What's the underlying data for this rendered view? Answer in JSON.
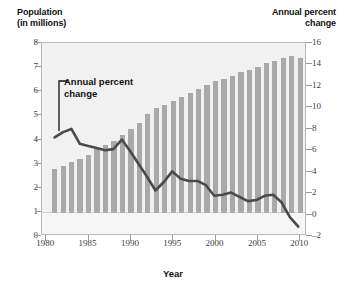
{
  "chart_data": {
    "type": "bar",
    "title": "",
    "subtitle": "",
    "xlabel": "Year",
    "left_axis": {
      "label": "Population\n(in millions)",
      "ticks": [
        0,
        1,
        2,
        3,
        4,
        5,
        6,
        7,
        8
      ],
      "ylim": [
        0,
        8
      ]
    },
    "right_axis": {
      "label": "Annual percent\nchange",
      "ticks": [
        -2,
        0,
        2,
        4,
        6,
        8,
        10,
        12,
        14,
        16
      ],
      "ylim": [
        -2,
        16
      ]
    },
    "xticks": [
      1980,
      1985,
      1990,
      1995,
      2000,
      2005,
      2010
    ],
    "xlim": [
      1979.5,
      2010.8
    ],
    "grid": false,
    "legend": "none",
    "annotations": [
      {
        "text": "Annual percent\nchange",
        "target_x": 1982,
        "target_y": 7.9
      }
    ],
    "x": [
      1981,
      1982,
      1983,
      1984,
      1985,
      1986,
      1987,
      1988,
      1989,
      1990,
      1991,
      1992,
      1993,
      1994,
      1995,
      1996,
      1997,
      1998,
      1999,
      2000,
      2001,
      2002,
      2003,
      2004,
      2005,
      2006,
      2007,
      2008,
      2009,
      2010
    ],
    "series": [
      {
        "name": "Population (in millions)",
        "type": "bar",
        "axis": "left",
        "color": "#a9a9a9",
        "values": [
          1.82,
          1.95,
          2.08,
          2.22,
          2.38,
          2.62,
          2.8,
          2.95,
          3.22,
          3.45,
          3.72,
          4.1,
          4.32,
          4.45,
          4.62,
          4.78,
          4.95,
          5.12,
          5.3,
          5.45,
          5.55,
          5.68,
          5.82,
          5.92,
          6.05,
          6.18,
          6.3,
          6.42,
          6.5,
          6.42
        ]
      },
      {
        "name": "Annual percent change",
        "type": "line",
        "axis": "right",
        "color": "#4a4a4a",
        "values": [
          7.1,
          7.6,
          7.9,
          6.5,
          6.3,
          6.1,
          5.9,
          6.0,
          6.9,
          5.8,
          4.6,
          3.4,
          2.1,
          2.9,
          3.9,
          3.2,
          3.0,
          3.0,
          2.6,
          1.6,
          1.7,
          1.9,
          1.5,
          1.1,
          1.2,
          1.6,
          1.7,
          1.0,
          -0.4,
          -1.3
        ]
      }
    ]
  },
  "labels": {
    "left_axis_title": "Population\n(in millions)",
    "right_axis_title": "Annual percent\nchange",
    "x_axis_title": "Year",
    "annotation": "Annual percent\nchange"
  },
  "colors": {
    "bar": "#a9a9a9",
    "line": "#4a4a4a",
    "plot_background": "#f1f1f1",
    "frame": "#b9b9b9",
    "text": "#111111"
  }
}
